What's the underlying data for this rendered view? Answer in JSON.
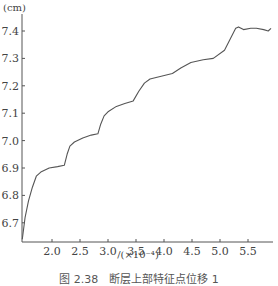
{
  "chart_data": {
    "type": "line",
    "title": "",
    "caption": "图 2.38　断层上部特征点位移 1",
    "xlabel": "/(×10⁻⁴)",
    "ylabel": "(cm)",
    "xlim": [
      1.46,
      5.92
    ],
    "ylim": [
      6.63,
      7.47
    ],
    "xticks": [
      "2.0",
      "2.5",
      "3.0",
      "3.5",
      "4.0",
      "4.5",
      "5.0",
      "5.5"
    ],
    "xtick_values": [
      2.0,
      2.5,
      3.0,
      3.5,
      4.0,
      4.5,
      5.0,
      5.5
    ],
    "yticks": [
      "6.7",
      "6.8",
      "6.9",
      "7.0",
      "7.1",
      "7.2",
      "7.3",
      "7.4"
    ],
    "ytick_values": [
      6.7,
      6.8,
      6.9,
      7.0,
      7.1,
      7.2,
      7.3,
      7.4
    ],
    "grid": false,
    "legend": null,
    "series": [
      {
        "name": "displacement",
        "color": "#555555",
        "x": [
          1.47,
          1.52,
          1.58,
          1.65,
          1.72,
          1.8,
          1.95,
          2.1,
          2.22,
          2.27,
          2.32,
          2.4,
          2.55,
          2.7,
          2.82,
          2.87,
          2.93,
          3.0,
          3.15,
          3.3,
          3.45,
          3.55,
          3.65,
          3.75,
          3.95,
          4.15,
          4.3,
          4.48,
          4.7,
          4.88,
          5.08,
          5.18,
          5.28,
          5.33,
          5.42,
          5.55,
          5.65,
          5.78,
          5.86,
          5.91
        ],
        "y": [
          6.64,
          6.72,
          6.78,
          6.83,
          6.87,
          6.885,
          6.9,
          6.905,
          6.91,
          6.95,
          6.98,
          6.995,
          7.01,
          7.02,
          7.025,
          7.06,
          7.09,
          7.105,
          7.125,
          7.135,
          7.145,
          7.18,
          7.21,
          7.225,
          7.235,
          7.245,
          7.265,
          7.285,
          7.295,
          7.3,
          7.33,
          7.37,
          7.41,
          7.415,
          7.405,
          7.41,
          7.41,
          7.405,
          7.4,
          7.41
        ]
      }
    ]
  }
}
